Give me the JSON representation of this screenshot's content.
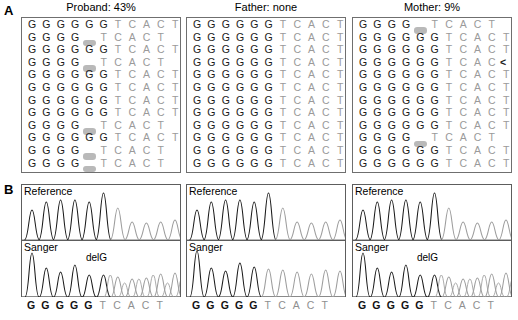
{
  "figure": {
    "panels": {
      "a_letter": "A",
      "b_letter": "B"
    }
  },
  "colors": {
    "dark_base": "#1a1a1a",
    "light_base": "#9a9a9a",
    "deletion_bar": "#b9b9b9",
    "box_border": "#6f6f6f",
    "trace_dark": "#1a1a1a",
    "trace_light": "#9d9d9d"
  },
  "panel_a": {
    "columns": [
      {
        "title": "Proband: 43%",
        "name": "proband",
        "reads": [
          [
            "G",
            "G",
            "G",
            "G",
            "G",
            "G",
            "T",
            "C",
            "A",
            "C",
            "T"
          ],
          [
            "G",
            "G",
            "G",
            "G",
            "-",
            "T",
            "C",
            "A",
            "C",
            "T"
          ],
          [
            "G",
            "G",
            "G",
            "G",
            "G",
            "G",
            "T",
            "C",
            "A",
            "C",
            "T"
          ],
          [
            "G",
            "G",
            "G",
            "G",
            "-",
            "T",
            "C",
            "A",
            "C",
            "T"
          ],
          [
            "G",
            "G",
            "G",
            "G",
            "G",
            "G",
            "T",
            "C",
            "A",
            "C",
            "T"
          ],
          [
            "G",
            "G",
            "G",
            "G",
            "G",
            "G",
            "T",
            "C",
            "A",
            "C",
            "T"
          ],
          [
            "G",
            "G",
            "G",
            "G",
            "G",
            "G",
            "T",
            "C",
            "A",
            "C",
            "T"
          ],
          [
            "G",
            "G",
            "G",
            "G",
            "G",
            "G",
            "T",
            "C",
            "A",
            "C",
            "T"
          ],
          [
            "G",
            "G",
            "G",
            "G",
            "-",
            "T",
            "C",
            "A",
            "C",
            "T"
          ],
          [
            "G",
            "G",
            "G",
            "G",
            "G",
            "G",
            "T",
            "C",
            "A",
            "C",
            "T"
          ],
          [
            "G",
            "G",
            "G",
            "G",
            "-",
            "T",
            "C",
            "A",
            "C",
            "T"
          ],
          [
            "G",
            "G",
            "G",
            "G",
            "-",
            "T",
            "C",
            "A",
            "C",
            "T"
          ]
        ]
      },
      {
        "title": "Father: none",
        "name": "father",
        "reads": [
          [
            "G",
            "G",
            "G",
            "G",
            "G",
            "G",
            "T",
            "C",
            "A",
            "C",
            "T"
          ],
          [
            "G",
            "G",
            "G",
            "G",
            "G",
            "G",
            "T",
            "C",
            "A",
            "C",
            "T"
          ],
          [
            "G",
            "G",
            "G",
            "G",
            "G",
            "G",
            "T",
            "C",
            "A",
            "C",
            "T"
          ],
          [
            "G",
            "G",
            "G",
            "G",
            "G",
            "G",
            "T",
            "C",
            "A",
            "C",
            "T"
          ],
          [
            "G",
            "G",
            "G",
            "G",
            "G",
            "G",
            "T",
            "C",
            "A",
            "C",
            "T"
          ],
          [
            "G",
            "G",
            "G",
            "G",
            "G",
            "G",
            "T",
            "C",
            "A",
            "C",
            "T"
          ],
          [
            "G",
            "G",
            "G",
            "G",
            "G",
            "G",
            "T",
            "C",
            "A",
            "C",
            "T"
          ],
          [
            "G",
            "G",
            "G",
            "G",
            "G",
            "G",
            "T",
            "C",
            "A",
            "C",
            "T"
          ],
          [
            "G",
            "G",
            "G",
            "G",
            "G",
            "G",
            "T",
            "C",
            "A",
            "C",
            "T"
          ],
          [
            "G",
            "G",
            "G",
            "G",
            "G",
            "G",
            "T",
            "C",
            "A",
            "C",
            "T"
          ],
          [
            "G",
            "G",
            "G",
            "G",
            "G",
            "G",
            "T",
            "C",
            "A",
            "C",
            "T"
          ],
          [
            "G",
            "G",
            "G",
            "G",
            "G",
            "G",
            "T",
            "C",
            "A",
            "C",
            "T"
          ]
        ]
      },
      {
        "title": "Mother: 9%",
        "name": "mother",
        "reads": [
          [
            "G",
            "G",
            "G",
            "G",
            "-",
            "T",
            "C",
            "A",
            "C",
            "T"
          ],
          [
            "G",
            "G",
            "G",
            "G",
            "G",
            "G",
            "T",
            "C",
            "A",
            "C",
            "T"
          ],
          [
            "G",
            "G",
            "G",
            "G",
            "G",
            "G",
            "T",
            "C",
            "A",
            "C",
            "T"
          ],
          [
            "G",
            "G",
            "G",
            "G",
            "G",
            "G",
            "T",
            "C",
            "A",
            "C",
            "<"
          ],
          [
            "G",
            "G",
            "G",
            "G",
            "G",
            "G",
            "T",
            "C",
            "A",
            "C",
            "T"
          ],
          [
            "G",
            "G",
            "G",
            "G",
            "G",
            "G",
            "T",
            "C",
            "A",
            "C",
            "T"
          ],
          [
            "G",
            "G",
            "G",
            "G",
            "G",
            "G",
            "T",
            "C",
            "A",
            "C",
            "T"
          ],
          [
            "G",
            "G",
            "G",
            "G",
            "G",
            "G",
            "T",
            "C",
            "A",
            "C",
            "T"
          ],
          [
            "G",
            "G",
            "G",
            "G",
            "G",
            "G",
            "T",
            "C",
            "A",
            "C",
            "T"
          ],
          [
            "G",
            "G",
            "G",
            "G",
            "-",
            "T",
            "C",
            "A",
            "C",
            "T"
          ],
          [
            "G",
            "G",
            "G",
            "G",
            "G",
            "G",
            "T",
            "C",
            "A",
            "C",
            "T"
          ],
          [
            "G",
            "G",
            "G",
            "G",
            "G",
            "G",
            "T",
            "C",
            "A",
            "C",
            "T"
          ]
        ]
      }
    ]
  },
  "panel_b": {
    "reference_label": "Reference",
    "sanger_label": "Sanger",
    "delg_label": "delG",
    "axis_sequence": [
      "G",
      "G",
      "G",
      "G",
      "G",
      "T",
      "C",
      "A",
      "C",
      "T"
    ],
    "axis_dark_count": 5,
    "columns": [
      {
        "name": "proband",
        "has_delg": true,
        "sanger_mixed": true
      },
      {
        "name": "father",
        "has_delg": false,
        "sanger_mixed": false
      },
      {
        "name": "mother",
        "has_delg": true,
        "sanger_mixed": true
      }
    ]
  },
  "chart_data": {
    "type": "line",
    "xlabel": "",
    "ylabel": "",
    "x": [
      "G",
      "G",
      "G",
      "G",
      "G",
      "T",
      "C",
      "A",
      "C",
      "T"
    ],
    "traces": [
      {
        "panel": "proband",
        "name": "Reference",
        "peak_heights": [
          30,
          38,
          40,
          40,
          38,
          47,
          32,
          18,
          17,
          18
        ],
        "peak_colors": [
          "dark",
          "dark",
          "dark",
          "dark",
          "dark",
          "dark",
          "light",
          "light",
          "light",
          "light"
        ]
      },
      {
        "panel": "proband",
        "name": "Sanger",
        "peak_heights": [
          44,
          30,
          26,
          32,
          22,
          22,
          20,
          18,
          20,
          24
        ],
        "peak_colors": [
          "dark",
          "dark",
          "dark",
          "dark",
          "dark",
          "dark",
          "light",
          "light",
          "light",
          "light"
        ],
        "note": "overlapping double peaks after delG position"
      },
      {
        "panel": "father",
        "name": "Reference",
        "peak_heights": [
          30,
          38,
          40,
          40,
          38,
          47,
          32,
          18,
          17,
          18
        ],
        "peak_colors": [
          "dark",
          "dark",
          "dark",
          "dark",
          "dark",
          "dark",
          "light",
          "light",
          "light",
          "light"
        ]
      },
      {
        "panel": "father",
        "name": "Sanger",
        "peak_heights": [
          46,
          30,
          26,
          34,
          30,
          28,
          26,
          24,
          22,
          26
        ],
        "peak_colors": [
          "dark",
          "dark",
          "dark",
          "dark",
          "dark",
          "dark",
          "light",
          "light",
          "light",
          "light"
        ],
        "note": "clean single peaks throughout"
      },
      {
        "panel": "mother",
        "name": "Reference",
        "peak_heights": [
          30,
          38,
          40,
          40,
          38,
          47,
          32,
          18,
          17,
          18
        ],
        "peak_colors": [
          "dark",
          "dark",
          "dark",
          "dark",
          "dark",
          "dark",
          "light",
          "light",
          "light",
          "light"
        ]
      },
      {
        "panel": "mother",
        "name": "Sanger",
        "peak_heights": [
          44,
          30,
          26,
          30,
          26,
          24,
          22,
          20,
          20,
          26
        ],
        "peak_colors": [
          "dark",
          "dark",
          "dark",
          "dark",
          "dark",
          "dark",
          "light",
          "light",
          "light",
          "light"
        ],
        "note": "overlapping double peaks after delG position"
      }
    ]
  }
}
